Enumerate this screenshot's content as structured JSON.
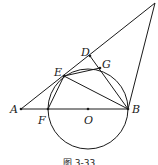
{
  "figure": {
    "caption": "图 3-33",
    "points": {
      "A": {
        "label": "A"
      },
      "F": {
        "label": "F"
      },
      "O": {
        "label": "O"
      },
      "B": {
        "label": "B"
      },
      "E": {
        "label": "E"
      },
      "D": {
        "label": "D"
      },
      "G": {
        "label": "G"
      }
    },
    "segments": [
      "A-C",
      "A-B",
      "B-C",
      "E-B",
      "E-G",
      "G-B",
      "D-B",
      "E-F"
    ],
    "circle": {
      "center": "O",
      "through": [
        "F",
        "B",
        "E",
        "G"
      ]
    }
  }
}
